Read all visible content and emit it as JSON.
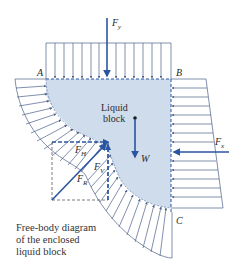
{
  "figure": {
    "title": "Free-body diagram of the enclosed liquid block",
    "colors": {
      "liquid_fill": "#cfdcec",
      "force_arrow": "#2b55a0",
      "pressure_lines": "#4a5f86",
      "dashed": "#2b55a0",
      "text": "#2a2a2a"
    }
  },
  "points": {
    "A": "A",
    "B": "B",
    "C": "C"
  },
  "block": {
    "label_line1": "Liquid",
    "label_line2": "block"
  },
  "forces": {
    "Fy": {
      "main": "F",
      "sub": "y"
    },
    "Fx": {
      "main": "F",
      "sub": "x"
    },
    "W": {
      "main": "W"
    },
    "FR": {
      "main": "F",
      "sub": "R"
    },
    "FH": {
      "main": "F",
      "sub": "H"
    },
    "FV": {
      "main": "F",
      "sub": "V"
    }
  },
  "caption": {
    "line1": "Free-body diagram",
    "line2": "of the enclosed",
    "line3": "liquid block"
  }
}
